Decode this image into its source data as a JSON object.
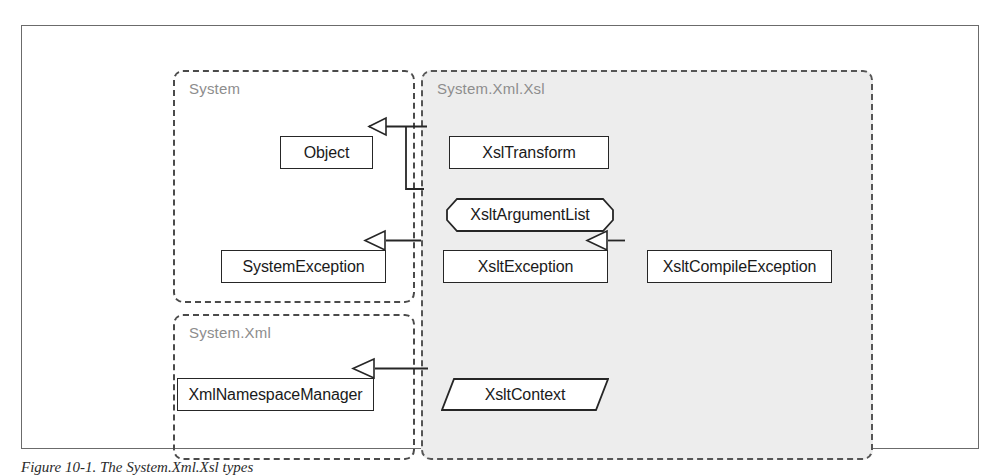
{
  "figure": {
    "caption": "Figure 10-1. The System.Xml.Xsl types",
    "frame_color": "#6b6b6b",
    "background": "#ffffff"
  },
  "packages": [
    {
      "id": "system",
      "label": "System",
      "style": "plain",
      "label_color": "#8d8d8d",
      "border_color": "#4a4a4a"
    },
    {
      "id": "system-xml",
      "label": "System.Xml",
      "style": "plain",
      "label_color": "#8d8d8d",
      "border_color": "#4a4a4a"
    },
    {
      "id": "system-xml-xsl",
      "label": "System.Xml.Xsl",
      "style": "shaded",
      "label_color": "#8d8d8d",
      "border_color": "#555555",
      "fill_color": "#ededed"
    }
  ],
  "nodes": [
    {
      "id": "object",
      "label": "Object",
      "shape": "rectangle",
      "package": "system"
    },
    {
      "id": "systemexception",
      "label": "SystemException",
      "shape": "rectangle",
      "package": "system"
    },
    {
      "id": "xmlnamespacemanager",
      "label": "XmlNamespaceManager",
      "shape": "rectangle",
      "package": "system-xml"
    },
    {
      "id": "xsltransform",
      "label": "XslTransform",
      "shape": "rectangle",
      "package": "system-xml-xsl"
    },
    {
      "id": "xsltargumentlist",
      "label": "XsltArgumentList",
      "shape": "chamfered",
      "package": "system-xml-xsl"
    },
    {
      "id": "xsltexception",
      "label": "XsltException",
      "shape": "rectangle",
      "package": "system-xml-xsl"
    },
    {
      "id": "xsltcompileexception",
      "label": "XsltCompileException",
      "shape": "rectangle",
      "package": "system-xml-xsl"
    },
    {
      "id": "xsltcontext",
      "label": "XsltContext",
      "shape": "parallelogram",
      "package": "system-xml-xsl"
    }
  ],
  "edges": [
    {
      "id": "edge-xsltransform-object",
      "from": "XslTransform",
      "to": "Object",
      "type": "inheritance"
    },
    {
      "id": "edge-xsltargumentlist-object",
      "from": "XsltArgumentList",
      "to": "Object",
      "type": "inheritance"
    },
    {
      "id": "edge-xsltexception-systemexception",
      "from": "XsltException",
      "to": "SystemException",
      "type": "inheritance"
    },
    {
      "id": "edge-xsltcompileexception-xsltexception",
      "from": "XsltCompileException",
      "to": "XsltException",
      "type": "inheritance"
    },
    {
      "id": "edge-xsltcontext-xmlnamespacemanager",
      "from": "XsltContext",
      "to": "XmlNamespaceManager",
      "type": "inheritance"
    }
  ]
}
